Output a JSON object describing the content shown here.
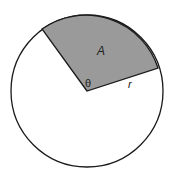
{
  "diagram": {
    "labels": {
      "area": "A",
      "angle": "θ",
      "radius": "r"
    },
    "colors": {
      "sector_fill": "#9a9a9a",
      "stroke": "#1a1a1a",
      "background": "#ffffff"
    }
  }
}
